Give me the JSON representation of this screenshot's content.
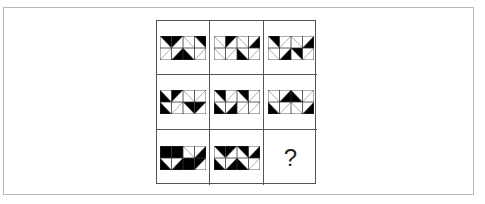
{
  "puzzle": {
    "question_mark": "?",
    "colors": {
      "fill": "#000000",
      "line": "#777777",
      "grid": "#555555",
      "frame": "#b8b8b8"
    },
    "legend": "Each panel: 4x2 squares; values: tl/tr/bl/br = filled triangle at that corner, d1 = empty with \\ diagonal, d2 = empty with / diagonal, full = fully black square",
    "cells": [
      {
        "row": 1,
        "col": 1,
        "top": [
          "tr",
          "tl",
          "d1",
          "tr"
        ],
        "bottom": [
          "d2",
          "br",
          "bl",
          "d2"
        ]
      },
      {
        "row": 1,
        "col": 2,
        "top": [
          "d1",
          "tl",
          "d1",
          "br"
        ],
        "bottom": [
          "d1",
          "d2",
          "bl",
          "d2"
        ]
      },
      {
        "row": 1,
        "col": 3,
        "top": [
          "tr",
          "d2",
          "d1",
          "br"
        ],
        "bottom": [
          "d1",
          "br",
          "tr",
          "d2"
        ]
      },
      {
        "row": 2,
        "col": 1,
        "top": [
          "bl",
          "tl",
          "d1",
          "d2"
        ],
        "bottom": [
          "bl",
          "d2",
          "tr",
          "tl"
        ]
      },
      {
        "row": 2,
        "col": 2,
        "top": [
          "tr",
          "d2",
          "tr",
          "d2"
        ],
        "bottom": [
          "bl",
          "br",
          "d2",
          "d2"
        ]
      },
      {
        "row": 2,
        "col": 3,
        "top": [
          "d1",
          "br",
          "bl",
          "d2"
        ],
        "bottom": [
          "bl",
          "d2",
          "d1",
          "br"
        ]
      },
      {
        "row": 3,
        "col": 1,
        "top": [
          "full",
          "full",
          "d1",
          "br"
        ],
        "bottom": [
          "bl",
          "br",
          "full",
          "tl"
        ]
      },
      {
        "row": 3,
        "col": 2,
        "top": [
          "tr",
          "tl",
          "tr",
          "br"
        ],
        "bottom": [
          "bl",
          "br",
          "bl",
          "d2"
        ]
      },
      {
        "row": 3,
        "col": 3,
        "missing": true
      }
    ]
  }
}
